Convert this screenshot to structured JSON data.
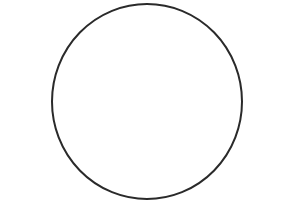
{
  "canvas": {
    "width": 293,
    "height": 204,
    "background_color": "#ffffff"
  },
  "figure": {
    "name": "circle-outline",
    "shape": "circle",
    "fill": "none",
    "fill_color": "#ffffff",
    "stroke_color": "#2a2a2a",
    "stroke_width": 2,
    "center_x": 147,
    "center_y": 101.5,
    "radius_x": 95,
    "radius_y": 97.5,
    "bounds": {
      "left": 52,
      "top": 4,
      "right": 242,
      "bottom": 199
    }
  },
  "text": {
    "labels": []
  }
}
